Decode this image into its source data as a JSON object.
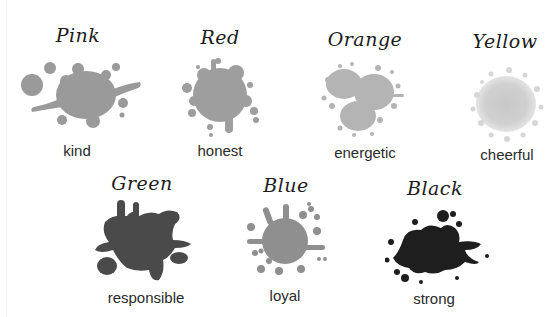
{
  "items": [
    {
      "title": "Pink",
      "word": "kind",
      "color": "#9a9a9a"
    },
    {
      "title": "Red",
      "word": "honest",
      "color": "#9e9e9e"
    },
    {
      "title": "Orange",
      "word": "energetic",
      "color": "#b4b4b4"
    },
    {
      "title": "Yellow",
      "word": "cheerful",
      "color": "#cfcfcf"
    },
    {
      "title": "Green",
      "word": "responsible",
      "color": "#4a4a4a"
    },
    {
      "title": "Blue",
      "word": "loyal",
      "color": "#8f8f8f"
    },
    {
      "title": "Black",
      "word": "strong",
      "color": "#1e1e1e"
    }
  ]
}
